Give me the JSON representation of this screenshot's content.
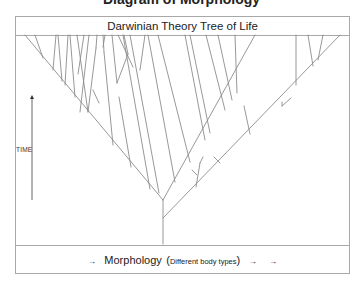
{
  "cut_title": "Diagram of Morphology",
  "header": {
    "title": "Darwinian Theory Tree of Life"
  },
  "axis": {
    "time_label": "TIME",
    "time_arrow": {
      "x": 32,
      "y1": 200,
      "y2": 95
    }
  },
  "footer": {
    "arrow_left": "→",
    "morphology": "Morphology",
    "paren_open": "(",
    "subtitle": "Different body types",
    "paren_close": ")",
    "arrow_right_1": "→",
    "arrow_right_2": "→"
  },
  "colors": {
    "line": "#8c8c8c",
    "frame": "#a8a8a8",
    "text": "#222222"
  },
  "tree": {
    "trunk": {
      "x": 163,
      "y_bottom": 244,
      "y_top": 218
    },
    "segments": [
      [
        163,
        244,
        163,
        200
      ],
      [
        163,
        200,
        25,
        35
      ],
      [
        163,
        218,
        340,
        35
      ],
      [
        163,
        200,
        255,
        35
      ],
      [
        43,
        58,
        35,
        35
      ],
      [
        53,
        70,
        56,
        35
      ],
      [
        62,
        81,
        58,
        35
      ],
      [
        65,
        85,
        68,
        35
      ],
      [
        75,
        97,
        70,
        35
      ],
      [
        88,
        112,
        77,
        35
      ],
      [
        88,
        112,
        96,
        48
      ],
      [
        96,
        48,
        97,
        35
      ],
      [
        78,
        74,
        84,
        35
      ],
      [
        80,
        112,
        89,
        35
      ],
      [
        113,
        145,
        104,
        52
      ],
      [
        104,
        52,
        103,
        35
      ],
      [
        103,
        47,
        105,
        35
      ],
      [
        99,
        103,
        93,
        90
      ],
      [
        131,
        167,
        119,
        97
      ],
      [
        150,
        189,
        123,
        35
      ],
      [
        117,
        83,
        112,
        35
      ],
      [
        117,
        83,
        128,
        54
      ],
      [
        128,
        54,
        124,
        35
      ],
      [
        140,
        70,
        145,
        35
      ],
      [
        133,
        67,
        118,
        35
      ],
      [
        159,
        193,
        130,
        35
      ],
      [
        175,
        182,
        148,
        35
      ],
      [
        190,
        162,
        158,
        35
      ],
      [
        205,
        140,
        185,
        35
      ],
      [
        210,
        133,
        190,
        35
      ],
      [
        225,
        110,
        206,
        35
      ],
      [
        232,
        100,
        218,
        35
      ],
      [
        237,
        93,
        235,
        35
      ],
      [
        196,
        187,
        200,
        163
      ],
      [
        200,
        163,
        203,
        157
      ],
      [
        197,
        175,
        192,
        170
      ],
      [
        220,
        163,
        214,
        157
      ],
      [
        250,
        134,
        244,
        106
      ],
      [
        282,
        106,
        291,
        98
      ],
      [
        282,
        106,
        282,
        102
      ],
      [
        296,
        85,
        296,
        35
      ],
      [
        313,
        66,
        308,
        35
      ],
      [
        318,
        60,
        323,
        35
      ]
    ]
  }
}
